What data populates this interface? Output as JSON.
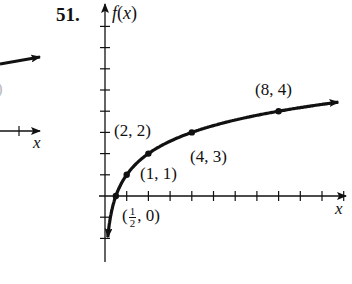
{
  "problem_number": "51.",
  "left_fragment": {
    "x_axis_label": "x",
    "paren_fragment": ")"
  },
  "chart_data": {
    "type": "line",
    "title": "",
    "function": "f(x) = 1 + log2(x)",
    "ylabel": "f(x)",
    "xlabel": "x",
    "grid": false,
    "xlim": [
      0,
      11
    ],
    "ylim": [
      -3,
      9
    ],
    "x_ticks": [
      1,
      2,
      3,
      4,
      5,
      6,
      7,
      8,
      9,
      10,
      11
    ],
    "y_ticks": [
      -2,
      -1,
      1,
      2,
      3,
      4,
      5,
      6,
      7,
      8
    ],
    "labeled_points": [
      {
        "x": 0.5,
        "y": 0,
        "label_whole": "(",
        "label_num": "1",
        "label_den": "2",
        "label_tail": ", 0)"
      },
      {
        "x": 1,
        "y": 1,
        "label": "(1, 1)"
      },
      {
        "x": 2,
        "y": 2,
        "label": "(2, 2)"
      },
      {
        "x": 4,
        "y": 3,
        "label": "(4, 3)"
      },
      {
        "x": 8,
        "y": 4,
        "label": "(8, 4)"
      }
    ],
    "color": "#111111"
  }
}
